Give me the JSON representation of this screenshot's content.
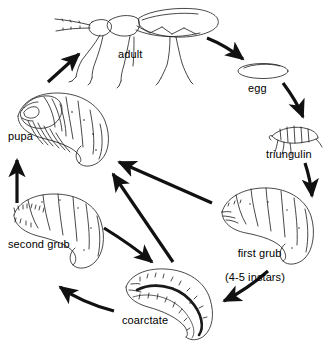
{
  "figure": {
    "kind": "insect-life-cycle-diagram",
    "background_color": "#ffffff",
    "line_color": "#000000",
    "arrow_color": "#111111"
  },
  "stages": [
    {
      "id": "adult",
      "label": "adult",
      "sublabel": "",
      "drawing": "adult-beetle-lateral"
    },
    {
      "id": "egg",
      "label": "egg",
      "sublabel": "",
      "drawing": "egg-oval"
    },
    {
      "id": "triungulin",
      "label": "triungulin",
      "sublabel": "",
      "drawing": "triungulin-larva"
    },
    {
      "id": "first-grub",
      "label": "first grub",
      "sublabel": "(4-5 instars)",
      "drawing": "c-shaped-grub"
    },
    {
      "id": "coarctate",
      "label": "coarctate",
      "sublabel": "",
      "drawing": "coarctate-larva"
    },
    {
      "id": "second-grub",
      "label": "second grub",
      "sublabel": "",
      "drawing": "c-shaped-grub"
    },
    {
      "id": "pupa",
      "label": "pupa",
      "sublabel": "",
      "drawing": "pupa-lateral"
    }
  ],
  "arrows": [
    {
      "id": "adult-to-egg",
      "from": "adult",
      "to": "egg",
      "shape": "curve-down-right"
    },
    {
      "id": "egg-to-triungulin",
      "from": "egg",
      "to": "triungulin",
      "shape": "curve-down"
    },
    {
      "id": "triungulin-to-first",
      "from": "triungulin",
      "to": "first-grub",
      "shape": "curve-down"
    },
    {
      "id": "first-to-coarctate",
      "from": "first-grub",
      "to": "coarctate",
      "shape": "curve-down-left"
    },
    {
      "id": "first-to-pupa",
      "from": "first-grub",
      "to": "pupa",
      "shape": "straight-up-left"
    },
    {
      "id": "coarctate-to-pupa",
      "from": "coarctate",
      "to": "pupa",
      "shape": "straight-up-left"
    },
    {
      "id": "coarctate-to-second",
      "from": "coarctate",
      "to": "second-grub",
      "shape": "curve-up-left"
    },
    {
      "id": "second-to-coarctate",
      "from": "second-grub",
      "to": "coarctate",
      "shape": "curve-down-right"
    },
    {
      "id": "second-to-pupa",
      "from": "second-grub",
      "to": "pupa",
      "shape": "straight-up"
    },
    {
      "id": "pupa-to-adult",
      "from": "pupa",
      "to": "adult",
      "shape": "straight-up-right"
    }
  ]
}
